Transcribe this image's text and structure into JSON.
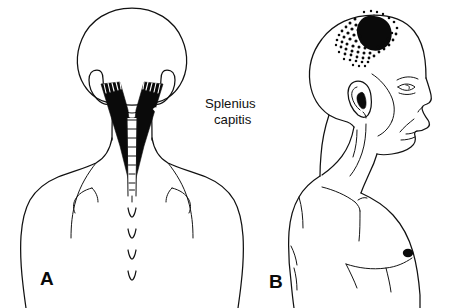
{
  "figure": {
    "background_color": "#ffffff",
    "ink_color": "#0a0a0a",
    "width": 460,
    "height": 308,
    "labels": {
      "muscle_name_line1": "Splenius",
      "muscle_name_line2": "capitis",
      "panel_a_letter": "A",
      "panel_b_letter": "B"
    },
    "panels": [
      {
        "id": "panel-a",
        "letter": "A",
        "view": "posterior",
        "description": "Back view of head, neck and upper torso showing the splenius capitis muscle shaded black in a V shape with a trigger point X",
        "markers": [
          {
            "name": "trigger-point-x",
            "symbol": "X",
            "color": "#ffffff",
            "x": 160,
            "y": 115
          }
        ],
        "spinous_process_count": 4
      },
      {
        "id": "panel-b",
        "letter": "B",
        "view": "lateral",
        "description": "Side view of head, neck and chest showing the referred pain pattern at the vertex of the skull as a solid black blob with stippled spillover",
        "markers": [
          {
            "name": "essential-pain-zone",
            "symbol": "solid",
            "color": "#0a0a0a",
            "x": 372,
            "y": 32
          },
          {
            "name": "spillover-pain-zone",
            "symbol": "stipple",
            "color": "#0a0a0a"
          },
          {
            "name": "nipple",
            "symbol": "solid",
            "color": "#0a0a0a",
            "x": 408,
            "y": 253
          }
        ]
      }
    ]
  }
}
